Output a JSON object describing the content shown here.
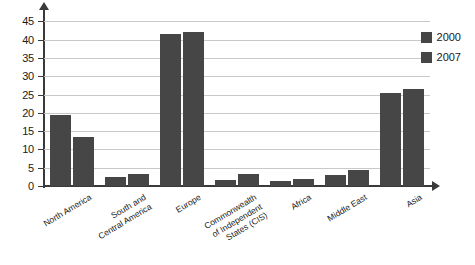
{
  "chart_data": {
    "type": "bar",
    "title": "",
    "subtitle": "",
    "xlabel": "",
    "ylabel": "",
    "ylim": [
      0,
      47
    ],
    "yticks": [
      0,
      5,
      10,
      15,
      20,
      25,
      30,
      35,
      40,
      45
    ],
    "grid": true,
    "legend_position": "top-right",
    "categories": [
      "North America",
      "South and\nCentral America",
      "Europe",
      "Commonwealth\nof Independent\nStates (CIS)",
      "Africa",
      "Middle East",
      "Asia"
    ],
    "series": [
      {
        "name": "2000",
        "color": "#464646",
        "values": [
          19.5,
          2.6,
          41.5,
          1.6,
          1.3,
          3.0,
          25.3
        ]
      },
      {
        "name": "2007",
        "color": "#464646",
        "values": [
          13.4,
          3.3,
          42.0,
          3.2,
          2.0,
          4.4,
          26.5
        ]
      }
    ]
  },
  "legend": {
    "entries": [
      {
        "label": "2000"
      },
      {
        "label": "2007"
      }
    ]
  },
  "axis": {
    "y_tick_labels": [
      "0",
      "5",
      "10",
      "15",
      "20",
      "25",
      "30",
      "35",
      "40",
      "45"
    ]
  },
  "colors": {
    "bar": "#464646",
    "gridline": "#c9c9c9",
    "axis": "#3a3a3a",
    "background": "#ffffff",
    "text": "#1a1a1a"
  }
}
